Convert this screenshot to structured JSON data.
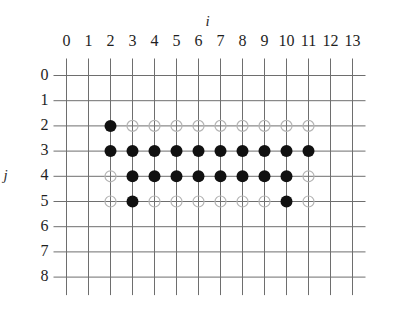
{
  "figure": {
    "name": "lattice-grid-scatter",
    "background_color": "#ffffff",
    "axes": {
      "i": {
        "title": "i",
        "position": "top",
        "tick_labels": [
          "0",
          "1",
          "2",
          "3",
          "4",
          "5",
          "6",
          "7",
          "8",
          "9",
          "10",
          "11",
          "12",
          "13"
        ],
        "min": 0,
        "max": 13
      },
      "j": {
        "title": "j",
        "position": "left",
        "tick_labels": [
          "0",
          "1",
          "2",
          "3",
          "4",
          "5",
          "6",
          "7",
          "8"
        ],
        "min": 0,
        "max": 8
      }
    },
    "grid": {
      "line_color": "#6e6e6e",
      "line_width": 1,
      "visible": true
    },
    "markers": {
      "filled_color": "#111111",
      "open_stroke_color": "#b4b4b4",
      "filled_radius": 6,
      "open_radius": 5.5
    }
  },
  "chart_data": {
    "type": "scatter",
    "title": "",
    "subtitle": "",
    "xlabel": "i",
    "ylabel": "j",
    "xlim": [
      0,
      13
    ],
    "ylim": [
      0,
      8
    ],
    "y_axis_inverted": true,
    "grid": true,
    "legend": null,
    "xticks": [
      0,
      1,
      2,
      3,
      4,
      5,
      6,
      7,
      8,
      9,
      10,
      11,
      12,
      13
    ],
    "yticks": [
      0,
      1,
      2,
      3,
      4,
      5,
      6,
      7,
      8
    ],
    "series": [
      {
        "name": "filled",
        "style": "filled-circle",
        "color": "#111111",
        "points": [
          {
            "i": 2,
            "j": 2
          },
          {
            "i": 2,
            "j": 3
          },
          {
            "i": 3,
            "j": 3
          },
          {
            "i": 4,
            "j": 3
          },
          {
            "i": 5,
            "j": 3
          },
          {
            "i": 6,
            "j": 3
          },
          {
            "i": 7,
            "j": 3
          },
          {
            "i": 8,
            "j": 3
          },
          {
            "i": 9,
            "j": 3
          },
          {
            "i": 10,
            "j": 3
          },
          {
            "i": 11,
            "j": 3
          },
          {
            "i": 3,
            "j": 4
          },
          {
            "i": 4,
            "j": 4
          },
          {
            "i": 5,
            "j": 4
          },
          {
            "i": 6,
            "j": 4
          },
          {
            "i": 7,
            "j": 4
          },
          {
            "i": 8,
            "j": 4
          },
          {
            "i": 9,
            "j": 4
          },
          {
            "i": 10,
            "j": 4
          },
          {
            "i": 3,
            "j": 5
          },
          {
            "i": 10,
            "j": 5
          }
        ]
      },
      {
        "name": "open",
        "style": "open-circle",
        "color": "#b4b4b4",
        "points": [
          {
            "i": 3,
            "j": 2
          },
          {
            "i": 4,
            "j": 2
          },
          {
            "i": 5,
            "j": 2
          },
          {
            "i": 6,
            "j": 2
          },
          {
            "i": 7,
            "j": 2
          },
          {
            "i": 8,
            "j": 2
          },
          {
            "i": 9,
            "j": 2
          },
          {
            "i": 10,
            "j": 2
          },
          {
            "i": 11,
            "j": 2
          },
          {
            "i": 2,
            "j": 4
          },
          {
            "i": 11,
            "j": 4
          },
          {
            "i": 2,
            "j": 5
          },
          {
            "i": 4,
            "j": 5
          },
          {
            "i": 5,
            "j": 5
          },
          {
            "i": 6,
            "j": 5
          },
          {
            "i": 7,
            "j": 5
          },
          {
            "i": 8,
            "j": 5
          },
          {
            "i": 9,
            "j": 5
          },
          {
            "i": 11,
            "j": 5
          }
        ]
      }
    ]
  }
}
